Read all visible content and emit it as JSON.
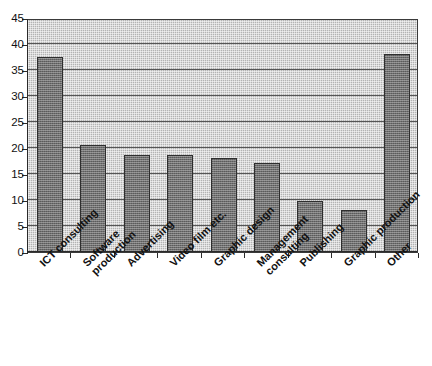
{
  "chart_data": {
    "type": "bar",
    "title": "",
    "subtitle": "",
    "xlabel": "",
    "ylabel": "",
    "ylim": [
      0,
      45
    ],
    "ytick_step": 5,
    "yticks": [
      0,
      5,
      10,
      15,
      20,
      25,
      30,
      35,
      40,
      45
    ],
    "ytick_labels": [
      "0",
      "5",
      "10",
      "15",
      "20",
      "25",
      "30",
      "35",
      "40",
      "45"
    ],
    "grid": true,
    "grid_axis": "y",
    "legend": false,
    "legend_position": "none",
    "categories": [
      "ICT consulting",
      "Software production",
      "Advertising",
      "Video film etc.",
      "Graphic design",
      "Management consulting",
      "Publishing",
      "Graphic production",
      "Other"
    ],
    "category_lines": [
      [
        "ICT consulting"
      ],
      [
        "Software",
        "production"
      ],
      [
        "Advertising"
      ],
      [
        "Video film etc."
      ],
      [
        "Graphic design"
      ],
      [
        "Management",
        "consulting"
      ],
      [
        "Publishing"
      ],
      [
        "Graphic production"
      ],
      [
        "Other"
      ]
    ],
    "values": [
      37.5,
      20.6,
      18.7,
      18.7,
      18.0,
      17.2,
      9.8,
      8.0,
      38.0
    ],
    "colors": {
      "bar_fill": "#6f6f6f",
      "bar_border": "#2e2e2e",
      "plot_background": "#b3b3b3",
      "gridline": "#555555",
      "axis": "#2a2a2a",
      "text": "#111111",
      "page_background": "#ffffff"
    }
  }
}
